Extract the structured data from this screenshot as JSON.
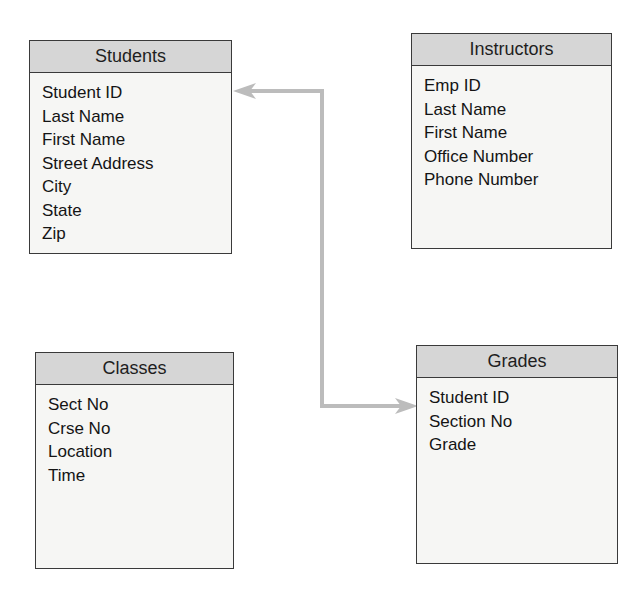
{
  "diagram": {
    "type": "entity-relationship",
    "entities": [
      {
        "name": "Students",
        "fields": [
          "Student ID",
          "Last Name",
          "First Name",
          "Street Address",
          "City",
          "State",
          "Zip"
        ]
      },
      {
        "name": "Instructors",
        "fields": [
          "Emp ID",
          "Last Name",
          "First Name",
          "Office Number",
          "Phone Number"
        ]
      },
      {
        "name": "Classes",
        "fields": [
          "Sect No",
          "Crse No",
          "Location",
          "Time"
        ]
      },
      {
        "name": "Grades",
        "fields": [
          "Student ID",
          "Section No",
          "Grade"
        ]
      }
    ],
    "relationships": [
      {
        "from": "Grades.Student ID",
        "to": "Students.Student ID",
        "style": "double-arrow",
        "color": "#b8b8b8"
      }
    ],
    "colors": {
      "header": "#d6d6d6",
      "border": "#3a3a3a",
      "body": "#f6f6f4",
      "connector": "#b8b8b8"
    }
  }
}
